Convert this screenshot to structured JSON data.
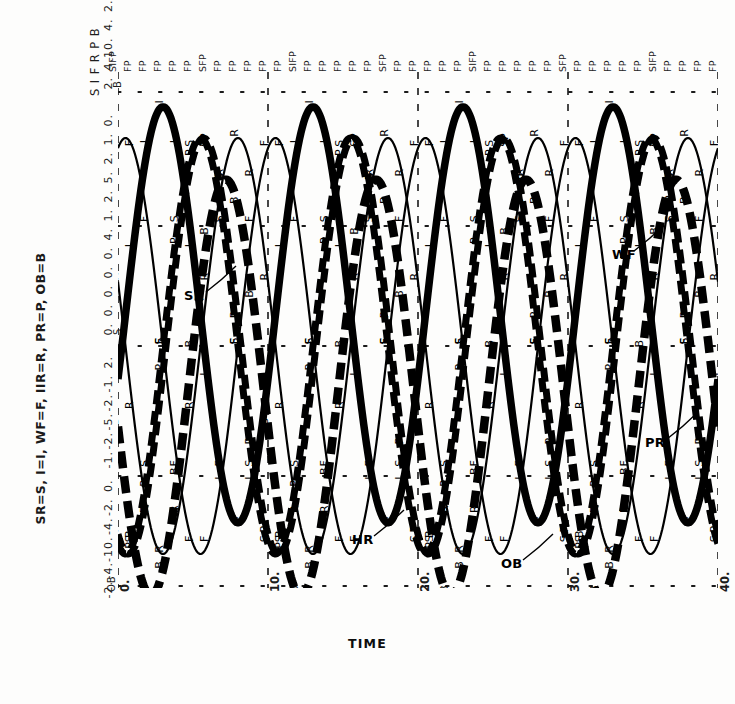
{
  "figure": {
    "legend_text": "SR=S, I=I, WF=F, IIR=R, PR=P, OB=B",
    "x_axis_title": "TIME"
  },
  "chart_data": {
    "type": "line",
    "title": "",
    "xlabel": "TIME",
    "ylabel": "",
    "xlim": [
      0,
      40
    ],
    "x_ticks": [
      "0",
      "10",
      "20",
      "30",
      "40"
    ],
    "grid": true,
    "legend_position": "inline-callouts",
    "top_axis_tick_labels": [
      "SIFP",
      "FP",
      "FP",
      "FP",
      "FP",
      "FP",
      "SFP",
      "FP",
      "FP",
      "FP",
      "FP",
      "FP",
      "SIFP",
      "FP",
      "FP",
      "FP",
      "FP",
      "FP",
      "SFP",
      "FP",
      "FP",
      "FP",
      "FP",
      "FP",
      "SIFP",
      "FP",
      "FP",
      "FP",
      "FP",
      "FP",
      "SFP",
      "FP",
      "FP",
      "FP",
      "FP",
      "FP",
      "SIFP",
      "FP",
      "FP",
      "FP",
      "FP"
    ],
    "y_axis_variables": [
      "S",
      "I",
      "F",
      "R",
      "P",
      "B"
    ],
    "y_axis_tick_rows": [
      {
        "position": "top",
        "values": [
          "2.",
          "4.",
          "10.",
          "4.",
          "2.",
          "0."
        ]
      },
      {
        "position": "upper",
        "values": [
          "1.",
          "2.",
          "5.",
          "2.",
          "1.",
          "0."
        ]
      },
      {
        "position": "middle",
        "values": [
          "0.",
          "0.",
          "0.",
          "0.",
          "0.",
          "4."
        ]
      },
      {
        "position": "lower",
        "values": [
          "-1.",
          "-2.",
          "-5.",
          "-2.",
          "-1.",
          "2."
        ]
      },
      {
        "position": "bottom",
        "values": [
          "-2.",
          "-4.",
          "-10.",
          "-4.",
          "-2.",
          "0."
        ]
      }
    ],
    "y_axis_corner_marks": [
      "B",
      "S",
      "OB"
    ],
    "series": [
      {
        "name": "SR",
        "code": "S",
        "style": "dashed-heavy",
        "amplitude": 1.0,
        "period": 10.0,
        "phase": 0.55,
        "mean": 0.0
      },
      {
        "name": "I",
        "code": "I",
        "style": "solid-heavy",
        "amplitude": 1.0,
        "period": 10.0,
        "phase": 0.3,
        "mean": 0.15
      },
      {
        "name": "WF",
        "code": "F",
        "style": "solid-thin",
        "amplitude": 1.0,
        "period": 10.0,
        "phase": 0.05,
        "mean": 0.0
      },
      {
        "name": "HR",
        "code": "R",
        "style": "solid-thin",
        "amplitude": 1.0,
        "period": 10.0,
        "phase": 0.8,
        "mean": 0.0
      },
      {
        "name": "PR",
        "code": "P",
        "style": "dashed-heavy",
        "amplitude": 1.0,
        "period": 10.0,
        "phase": 0.57,
        "mean": 0.0
      },
      {
        "name": "OB",
        "code": "B",
        "style": "dashed-very-heavy",
        "amplitude": 1.0,
        "period": 10.0,
        "phase": 0.72,
        "mean": -0.2
      }
    ],
    "callouts": [
      {
        "label": "SR",
        "x_px": 184,
        "y_px": 288
      },
      {
        "label": "WF",
        "x_px": 612,
        "y_px": 247
      },
      {
        "label": "PR",
        "x_px": 645,
        "y_px": 435
      },
      {
        "label": "HR",
        "x_px": 352,
        "y_px": 532
      },
      {
        "label": "OB",
        "x_px": 501,
        "y_px": 556
      }
    ],
    "colors": {
      "ink": "#000000",
      "grid": "#1a1a1a",
      "background": "#fdfdfc"
    }
  }
}
